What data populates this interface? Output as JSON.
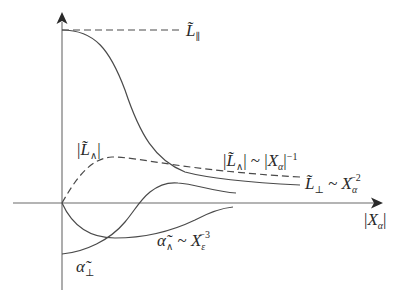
{
  "colors": {
    "background": "#ffffff",
    "curve": "#4a4a4a",
    "axis": "#6a6a6a",
    "text": "#2a2a2a"
  },
  "axes": {
    "x_label": {
      "open": "|",
      "main": "X",
      "sub": "α",
      "close": "|"
    },
    "y_label": null
  },
  "labels": {
    "L_parallel": {
      "main": "L̃",
      "sub": "∥"
    },
    "L_wedge_abs": {
      "open": "|",
      "main": "L̃",
      "sub": "∧",
      "close": "|"
    },
    "L_wedge_asymptote": {
      "open": "|",
      "main": "L̃",
      "sub": "∧",
      "mid": "| ~ |",
      "var": "X",
      "var_sub": "α",
      "close": "|",
      "exp": "−1"
    },
    "L_perp_asymptote": {
      "main": "L̃",
      "sub": "⊥",
      "sim": " ~ ",
      "var": "X",
      "var_sub": "α",
      "exp": "−2"
    },
    "alpha_wedge_asymptote": {
      "main": "α̃",
      "sub": "∧",
      "sim": " ~ ",
      "var": "X",
      "var_sub": "ε",
      "exp": "−3"
    },
    "alpha_perp": {
      "main": "α̃",
      "sub": "⊥"
    }
  },
  "curves": [
    {
      "name": "L_parallel",
      "style": "dashed",
      "description": "constant at initial value"
    },
    {
      "name": "L_perp",
      "style": "solid",
      "description": "starts at L_parallel level, decays as X_alpha^-2"
    },
    {
      "name": "abs_L_wedge",
      "style": "dashed",
      "description": "starts at 0, peaks, decays as |X_alpha|^-1"
    },
    {
      "name": "alpha_wedge",
      "style": "solid",
      "description": "starts at 0, dips negative, returns as X_eps^-3"
    },
    {
      "name": "alpha_perp",
      "style": "solid",
      "description": "starts negative, crosses zero, peaks, decays"
    }
  ]
}
